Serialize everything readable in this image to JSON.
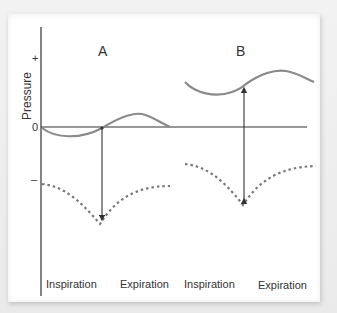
{
  "diagram": {
    "y_axis": {
      "label": "Pressure",
      "ticks": {
        "plus": "+",
        "zero": "0",
        "minus": "–"
      }
    },
    "panels": [
      {
        "label": "A",
        "x_labels": [
          "Inspiration",
          "Expiration"
        ]
      },
      {
        "label": "B",
        "x_labels": [
          "Inspiration",
          "Expiration"
        ]
      }
    ],
    "colors": {
      "solid_curve": "#8a8a8a",
      "dotted_curve": "#777777",
      "axis": "#333333",
      "arrow": "#333333"
    }
  }
}
